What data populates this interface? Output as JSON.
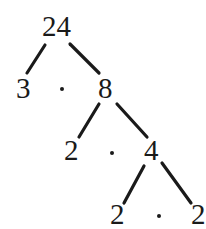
{
  "diagram": {
    "type": "factor-tree",
    "nodes": [
      {
        "id": "root",
        "label": "24",
        "x": 42,
        "y": 12
      },
      {
        "id": "n3",
        "label": "3",
        "x": 16,
        "y": 74
      },
      {
        "id": "n8",
        "label": "8",
        "x": 98,
        "y": 74
      },
      {
        "id": "n2a",
        "label": "2",
        "x": 64,
        "y": 136
      },
      {
        "id": "n4",
        "label": "4",
        "x": 144,
        "y": 136
      },
      {
        "id": "n2b",
        "label": "2",
        "x": 110,
        "y": 200
      },
      {
        "id": "n2c",
        "label": "2",
        "x": 191,
        "y": 200
      }
    ],
    "edges": [
      {
        "from": "24",
        "to": "3",
        "x1": 45,
        "y1": 45,
        "x2": 27,
        "y2": 73
      },
      {
        "from": "24",
        "to": "8",
        "x1": 70,
        "y1": 44,
        "x2": 99,
        "y2": 73
      },
      {
        "from": "8",
        "to": "2",
        "x1": 99,
        "y1": 104,
        "x2": 79,
        "y2": 137
      },
      {
        "from": "8",
        "to": "4",
        "x1": 117,
        "y1": 104,
        "x2": 147,
        "y2": 137
      },
      {
        "from": "4",
        "to": "2",
        "x1": 144,
        "y1": 166,
        "x2": 124,
        "y2": 203
      },
      {
        "from": "4",
        "to": "2",
        "x1": 162,
        "y1": 163,
        "x2": 191,
        "y2": 203
      }
    ],
    "dots": [
      {
        "x": 60,
        "y": 87
      },
      {
        "x": 110,
        "y": 151
      },
      {
        "x": 157,
        "y": 214
      }
    ],
    "colors": {
      "ink": "#1a1a1a",
      "background": "#ffffff"
    }
  }
}
